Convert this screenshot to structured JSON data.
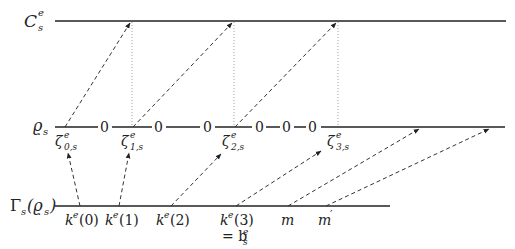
{
  "rows": {
    "top": {
      "label": "C",
      "sup": "e",
      "sub": "s"
    },
    "middle": {
      "label": "ϱ",
      "sub": "s"
    },
    "bottom": {
      "label": "Γ",
      "sub": "s",
      "arg": "(ϱ",
      "argsub": "s",
      "close": ")"
    }
  },
  "middle_zeros": [
    "0",
    "0",
    "0",
    "0",
    "0",
    "0"
  ],
  "zeta_labels": [
    {
      "base": "ζ",
      "sup": "e",
      "sub": "0,s"
    },
    {
      "base": "ζ",
      "sup": "e",
      "sub": "1,s"
    },
    {
      "base": "ζ",
      "sup": "e",
      "sub": "2,s"
    },
    {
      "base": "ζ",
      "sup": "e",
      "sub": "3,s"
    }
  ],
  "bottom_labels": [
    {
      "base": "k",
      "sup": "e",
      "arg": "(0)"
    },
    {
      "base": "k",
      "sup": "e",
      "arg": "(1)"
    },
    {
      "base": "k",
      "sup": "e",
      "arg": "(2)"
    },
    {
      "base": "k",
      "sup": "e",
      "arg": "(3)"
    },
    {
      "base": "m",
      "sup": "",
      "arg": ""
    },
    {
      "base": "m",
      "sup": "′",
      "arg": ""
    }
  ],
  "k3_equal": {
    "eq": "= b",
    "sup": "e",
    "sub": "s"
  }
}
